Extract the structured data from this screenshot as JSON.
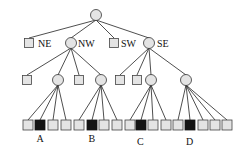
{
  "diagram": {
    "title": "",
    "type": "quadtree",
    "colors": {
      "node_fill": "#e4e4e4",
      "filled_leaf": "#141414",
      "stroke": "#333333"
    },
    "root": {
      "shape": "circle",
      "x": 96,
      "y": 15
    },
    "level1": [
      {
        "shape": "square",
        "label": "NE",
        "x": 29,
        "y": 43
      },
      {
        "shape": "circle",
        "label": "NW",
        "x": 71,
        "y": 43
      },
      {
        "shape": "square",
        "label": "SW",
        "x": 114,
        "y": 43
      },
      {
        "shape": "circle",
        "label": "SE",
        "x": 149,
        "y": 43
      }
    ],
    "level2": [
      {
        "shape": "square",
        "parent": "NW",
        "x": 27,
        "y": 80
      },
      {
        "shape": "circle",
        "parent": "NW",
        "x": 58,
        "y": 80
      },
      {
        "shape": "square",
        "parent": "NW",
        "x": 79,
        "y": 80
      },
      {
        "shape": "circle",
        "parent": "NW",
        "x": 101,
        "y": 80
      },
      {
        "shape": "square",
        "parent": "SE",
        "x": 120,
        "y": 80
      },
      {
        "shape": "square",
        "parent": "SE",
        "x": 137,
        "y": 80
      },
      {
        "shape": "circle",
        "parent": "SE",
        "x": 151,
        "y": 80
      },
      {
        "shape": "circle",
        "parent": "SE",
        "x": 186,
        "y": 80
      }
    ],
    "leaves": [
      {
        "x": 28,
        "filled": false,
        "parent": 1
      },
      {
        "x": 40,
        "filled": true,
        "parent": 1,
        "label": "A"
      },
      {
        "x": 53,
        "filled": false,
        "parent": 1
      },
      {
        "x": 66,
        "filled": false,
        "parent": 1
      },
      {
        "x": 79,
        "filled": false,
        "parent": 3
      },
      {
        "x": 92,
        "filled": true,
        "parent": 3,
        "label": "B"
      },
      {
        "x": 104,
        "filled": false,
        "parent": 3
      },
      {
        "x": 117,
        "filled": false,
        "parent": 3
      },
      {
        "x": 130,
        "filled": false,
        "parent": 6
      },
      {
        "x": 141,
        "filled": true,
        "parent": 6,
        "label": "C"
      },
      {
        "x": 153,
        "filled": false,
        "parent": 6
      },
      {
        "x": 166,
        "filled": false,
        "parent": 6
      },
      {
        "x": 178,
        "filled": false,
        "parent": 7
      },
      {
        "x": 190,
        "filled": true,
        "parent": 7,
        "label": "D"
      },
      {
        "x": 203,
        "filled": false,
        "parent": 7
      },
      {
        "x": 215,
        "filled": false,
        "parent": 7
      },
      {
        "x": 227,
        "filled": false,
        "parent": 7
      }
    ],
    "leaf_y": 125,
    "labels": {
      "ne": "NE",
      "nw": "NW",
      "sw": "SW",
      "se": "SE",
      "a": "A",
      "b": "B",
      "c": "C",
      "d": "D"
    }
  }
}
